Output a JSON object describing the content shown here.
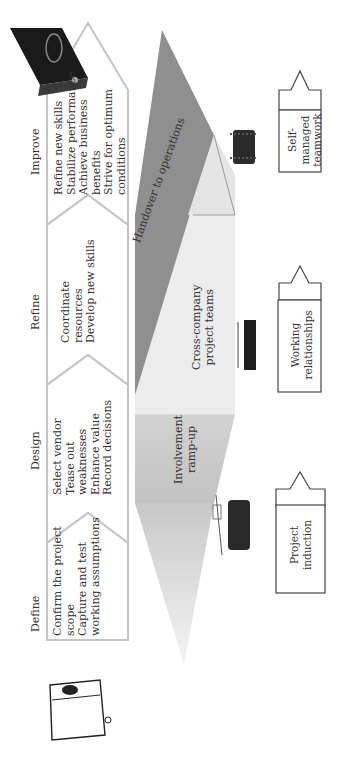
{
  "phases": [
    {
      "label": "Define",
      "items": [
        "Confirm the project",
        "scope",
        "Capture and test",
        "working assumptions"
      ]
    },
    {
      "label": "Design",
      "items": [
        "Select vendor",
        "Tease out",
        "weaknesses",
        "Enhance value",
        "Record decisions"
      ]
    },
    {
      "label": "Refine",
      "items": [
        "Coordinate",
        "resources",
        "Develop new skills"
      ]
    },
    {
      "label": "Improve",
      "items": [
        "Refine new skills",
        "Stabilize performance",
        "Achieve business",
        "benefits",
        "Strive for optimum",
        "conditions"
      ]
    }
  ],
  "bands": [
    {
      "label_lines": [
        "Involvement",
        "ramp-up"
      ]
    },
    {
      "label_lines": [
        "Cross-company",
        "project teams"
      ]
    },
    {
      "label_lines": [
        "Handover to operations"
      ]
    }
  ],
  "outcome_boxes": [
    {
      "label_lines": [
        "Project",
        "induction"
      ]
    },
    {
      "label_lines": [
        "Working",
        "relationships"
      ]
    },
    {
      "label_lines": [
        "Self-",
        "managed",
        "teamwork"
      ]
    }
  ],
  "icons": {
    "closed_binder": "binder-closed-icon",
    "open_binder": "binder-open-icon",
    "meeting_people": "meeting-clipart-icon",
    "team_table": "team-table-clipart-icon",
    "team_group": "team-group-clipart-icon"
  },
  "colors": {
    "chevron_stroke": "#c4c4c4",
    "band_light": "#ececec",
    "band_mid": "#bdbdbd",
    "band_dark": "#8f8f8f",
    "box_stroke": "#444444"
  }
}
